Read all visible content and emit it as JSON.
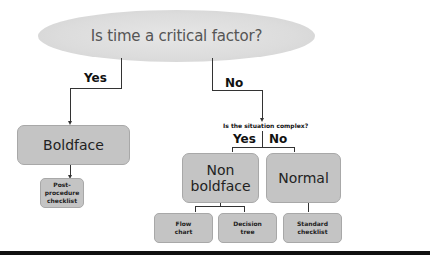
{
  "diagram": {
    "root_question": "Is time a critical factor?",
    "root_branches": {
      "yes_label": "Yes",
      "no_label": "No"
    },
    "nodes": {
      "boldface": "Boldface",
      "post_procedure": "Post-procedure checklist",
      "sub_question": "Is the situation complex?",
      "sub_yes_label": "Yes",
      "sub_no_label": "No",
      "non_boldface": "Non boldface",
      "normal": "Normal",
      "flow_chart": "Flow chart",
      "decision_tree": "Decision tree",
      "standard_checklist": "Standard checklist"
    },
    "colors": {
      "node_fill": "#c4c4c4",
      "ellipse_fill": "#dcdcdc",
      "line": "#333333",
      "bottom_bar": "#111111"
    }
  }
}
